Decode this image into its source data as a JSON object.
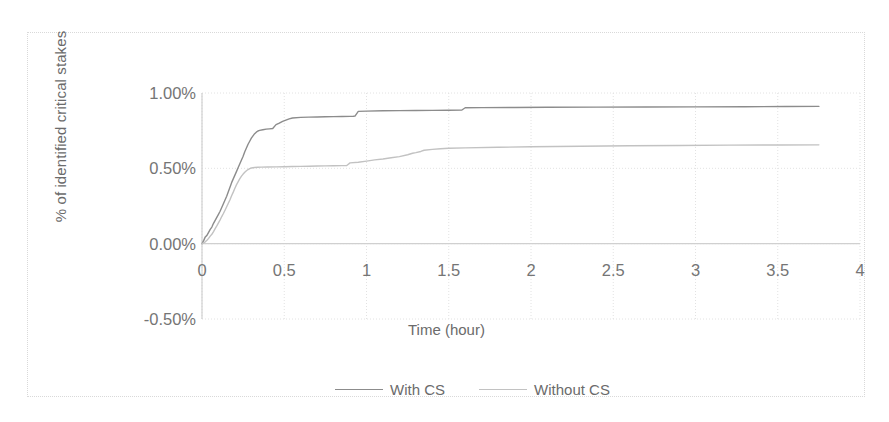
{
  "chart_data": {
    "type": "line",
    "title": "",
    "xlabel": "Time (hour)",
    "ylabel": "% of identified critical stakes",
    "xlim": [
      0,
      4
    ],
    "ylim": [
      -0.5,
      1.0
    ],
    "xticks": [
      "0",
      "0.5",
      "1",
      "1.5",
      "2",
      "2.5",
      "3",
      "3.5",
      "4"
    ],
    "xtick_values": [
      0,
      0.5,
      1,
      1.5,
      2,
      2.5,
      3,
      3.5,
      4
    ],
    "yticks": [
      "-0.50%",
      "0.00%",
      "0.50%",
      "1.00%"
    ],
    "ytick_values": [
      -0.5,
      0,
      0.5,
      1.0
    ],
    "grid": true,
    "legend_position": "bottom",
    "series": [
      {
        "name": "With CS",
        "color": "#8c8c8c",
        "style": "solid",
        "x": [
          0.0,
          0.01,
          0.02,
          0.03,
          0.04,
          0.05,
          0.06,
          0.07,
          0.08,
          0.09,
          0.1,
          0.11,
          0.12,
          0.13,
          0.14,
          0.15,
          0.16,
          0.17,
          0.18,
          0.19,
          0.2,
          0.21,
          0.22,
          0.23,
          0.24,
          0.25,
          0.26,
          0.27,
          0.28,
          0.29,
          0.3,
          0.31,
          0.32,
          0.33,
          0.34,
          0.35,
          0.37,
          0.39,
          0.41,
          0.43,
          0.45,
          0.47,
          0.49,
          0.51,
          0.53,
          0.55,
          0.6,
          0.65,
          0.7,
          0.75,
          0.8,
          0.85,
          0.9,
          0.92,
          0.93,
          0.95,
          1.0,
          1.1,
          1.2,
          1.3,
          1.4,
          1.5,
          1.58,
          1.6,
          1.7,
          1.9,
          2.1,
          2.4,
          2.7,
          3.0,
          3.3,
          3.55,
          3.75
        ],
        "y": [
          0.0,
          0.02,
          0.045,
          0.055,
          0.075,
          0.095,
          0.11,
          0.135,
          0.155,
          0.175,
          0.195,
          0.215,
          0.24,
          0.265,
          0.29,
          0.315,
          0.345,
          0.375,
          0.405,
          0.43,
          0.455,
          0.48,
          0.505,
          0.53,
          0.555,
          0.58,
          0.61,
          0.635,
          0.66,
          0.68,
          0.7,
          0.715,
          0.73,
          0.74,
          0.748,
          0.752,
          0.756,
          0.76,
          0.762,
          0.764,
          0.79,
          0.8,
          0.812,
          0.82,
          0.828,
          0.834,
          0.838,
          0.84,
          0.841,
          0.842,
          0.843,
          0.844,
          0.845,
          0.846,
          0.847,
          0.878,
          0.88,
          0.882,
          0.883,
          0.884,
          0.885,
          0.886,
          0.887,
          0.902,
          0.903,
          0.904,
          0.905,
          0.906,
          0.907,
          0.908,
          0.909,
          0.91,
          0.911
        ]
      },
      {
        "name": "Without CS",
        "color": "#c2c2c2",
        "style": "solid",
        "x": [
          0.0,
          0.01,
          0.02,
          0.03,
          0.04,
          0.05,
          0.06,
          0.07,
          0.08,
          0.09,
          0.1,
          0.11,
          0.12,
          0.13,
          0.14,
          0.15,
          0.16,
          0.17,
          0.18,
          0.19,
          0.2,
          0.21,
          0.22,
          0.23,
          0.24,
          0.25,
          0.26,
          0.27,
          0.28,
          0.29,
          0.3,
          0.31,
          0.32,
          0.34,
          0.36,
          0.4,
          0.45,
          0.5,
          0.55,
          0.6,
          0.65,
          0.7,
          0.75,
          0.8,
          0.85,
          0.88,
          0.9,
          0.95,
          1.0,
          1.05,
          1.1,
          1.15,
          1.2,
          1.25,
          1.28,
          1.3,
          1.33,
          1.35,
          1.4,
          1.45,
          1.5,
          1.6,
          1.8,
          2.0,
          2.3,
          2.6,
          2.9,
          3.2,
          3.5,
          3.75
        ],
        "y": [
          0.0,
          0.005,
          0.012,
          0.022,
          0.035,
          0.05,
          0.062,
          0.08,
          0.1,
          0.118,
          0.138,
          0.158,
          0.18,
          0.2,
          0.222,
          0.245,
          0.268,
          0.292,
          0.318,
          0.342,
          0.368,
          0.392,
          0.412,
          0.432,
          0.448,
          0.462,
          0.474,
          0.484,
          0.492,
          0.498,
          0.502,
          0.504,
          0.506,
          0.507,
          0.508,
          0.509,
          0.51,
          0.511,
          0.512,
          0.513,
          0.514,
          0.515,
          0.516,
          0.517,
          0.518,
          0.519,
          0.536,
          0.54,
          0.548,
          0.556,
          0.562,
          0.57,
          0.578,
          0.59,
          0.6,
          0.604,
          0.612,
          0.62,
          0.626,
          0.63,
          0.633,
          0.636,
          0.64,
          0.643,
          0.647,
          0.65,
          0.652,
          0.654,
          0.655,
          0.656
        ]
      }
    ]
  },
  "axes": {
    "y_title": "% of identified critical stakes",
    "x_title": "Time (hour)",
    "y_tick_labels": [
      "1.00%",
      "0.50%",
      "0.00%",
      "-0.50%"
    ],
    "x_tick_labels": [
      "0",
      "0.5",
      "1",
      "1.5",
      "2",
      "2.5",
      "3",
      "3.5",
      "4"
    ]
  },
  "legend": {
    "items": [
      {
        "label": "With CS",
        "color": "#8c8c8c"
      },
      {
        "label": "Without CS",
        "color": "#c2c2c2"
      }
    ]
  },
  "colors": {
    "with_cs": "#8c8c8c",
    "without_cs": "#c2c2c2",
    "grid": "#e2e2e2",
    "axis": "#d0d0d0",
    "text": "#757575",
    "frame": "#d9d9d9"
  }
}
